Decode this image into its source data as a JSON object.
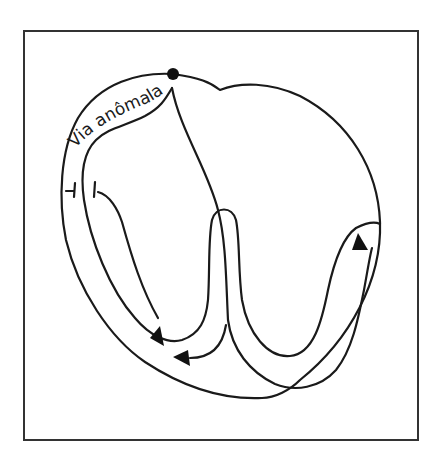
{
  "figure": {
    "labels": {
      "anomalous_pathway": "Via anômala"
    },
    "colors": {
      "stroke": "#1a1a1a",
      "frame": "#333333",
      "background": "#ffffff"
    },
    "elements": [
      "heart-outline",
      "sinus-node-dot",
      "anomalous-pathway-band",
      "conduction-loop",
      "arrow-left-down",
      "arrow-center-left",
      "arrow-right-up",
      "block-bars"
    ]
  }
}
